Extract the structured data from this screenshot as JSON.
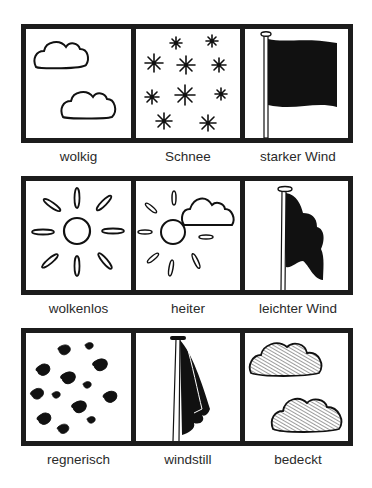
{
  "cards": [
    {
      "label": "wolkig",
      "icon": "two-clouds-outline-icon"
    },
    {
      "label": "Schnee",
      "icon": "snowflakes-icon"
    },
    {
      "label": "starker Wind",
      "icon": "flag-strong-wind-icon"
    },
    {
      "label": "wolkenlos",
      "icon": "sun-icon"
    },
    {
      "label": "heiter",
      "icon": "sun-with-cloud-icon"
    },
    {
      "label": "leichter Wind",
      "icon": "flag-light-wind-icon"
    },
    {
      "label": "regnerisch",
      "icon": "raindrops-icon"
    },
    {
      "label": "windstill",
      "icon": "flag-no-wind-icon"
    },
    {
      "label": "bedeckt",
      "icon": "two-clouds-hatched-icon"
    }
  ],
  "colors": {
    "frame": "#1c1c1c",
    "ink": "#111111",
    "label": "#2a2a2a",
    "background": "#ffffff"
  }
}
